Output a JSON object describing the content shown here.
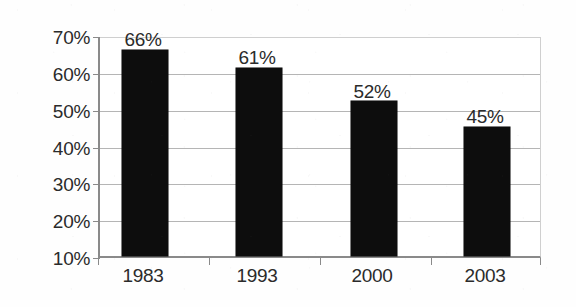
{
  "chart_data": {
    "type": "bar",
    "title": "",
    "subtitle": "",
    "xlabel": "",
    "ylabel": "",
    "categories": [
      "1983",
      "1993",
      "2000",
      "2003"
    ],
    "values": [
      66,
      61,
      52,
      45
    ],
    "data_labels": [
      "66%",
      "61%",
      "52%",
      "45%"
    ],
    "ylim": [
      10,
      70
    ],
    "y_ticks": [
      70,
      60,
      50,
      40,
      30,
      20,
      10
    ],
    "y_tick_labels": [
      "70%",
      "60%",
      "50%",
      "40%",
      "30%",
      "20%",
      "10%"
    ],
    "grid": true,
    "legend": "none",
    "series": [
      {
        "name": "",
        "values": [
          66,
          61,
          52,
          45
        ],
        "color": "#0d0d0d"
      }
    ],
    "colors": {
      "bar": "#0d0d0d",
      "gridline": "#b5b5b5",
      "axis": "#8a8a8a",
      "text": "#2b2b2b",
      "background": "#ffffff"
    }
  }
}
